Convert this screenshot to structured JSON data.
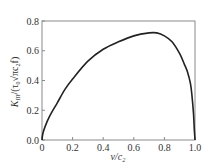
{
  "chart_data": {
    "type": "line",
    "title": "",
    "xlabel": "v/c₂",
    "ylabel": "K₃/(τ₀√πc₂f)",
    "ylabel_parts": {
      "main": "K",
      "sub": "III",
      "rest": "/(τ",
      "sub2": "0",
      "sqrt": "√πc",
      "sub3": "2",
      "tail": "f)"
    },
    "xlim": [
      0,
      1.0
    ],
    "ylim": [
      0,
      0.8
    ],
    "xticks": [
      0,
      0.2,
      0.4,
      0.6,
      0.8,
      1.0
    ],
    "xtick_labels": [
      "0",
      "0.2",
      "0.4",
      "0.6",
      "0.8",
      "1.0"
    ],
    "yticks": [
      0.0,
      0.2,
      0.4,
      0.6,
      0.8
    ],
    "ytick_labels": [
      "0.0",
      "0.2",
      "0.4",
      "0.6",
      "0.8"
    ],
    "grid": false,
    "legend": null,
    "series": [
      {
        "name": "K_III",
        "x": [
          0,
          0.005,
          0.02,
          0.05,
          0.1,
          0.15,
          0.2,
          0.3,
          0.4,
          0.5,
          0.6,
          0.7,
          0.75,
          0.8,
          0.85,
          0.9,
          0.93,
          0.95,
          0.97,
          0.98,
          0.99,
          0.995,
          1.0
        ],
        "y": [
          0,
          0.04,
          0.09,
          0.16,
          0.25,
          0.34,
          0.41,
          0.53,
          0.61,
          0.66,
          0.7,
          0.72,
          0.72,
          0.7,
          0.66,
          0.58,
          0.51,
          0.46,
          0.38,
          0.3,
          0.18,
          0.08,
          0
        ]
      }
    ],
    "colors": {
      "line": "#222222",
      "axis": "#888888",
      "text": "#333333"
    }
  }
}
